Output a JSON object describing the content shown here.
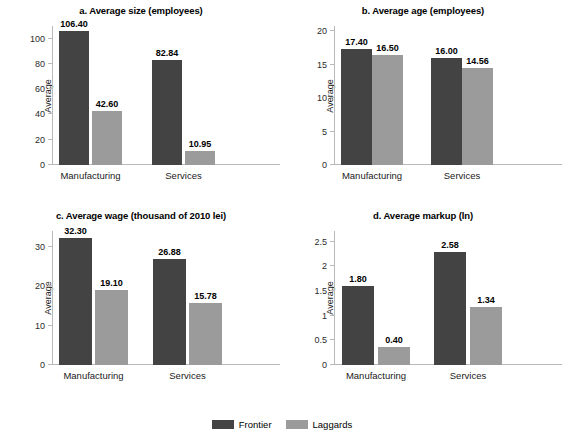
{
  "figure": {
    "background": "#ffffff",
    "colors": {
      "frontier": "#434343",
      "laggards": "#9b9b9b",
      "axis": "#b9b9b9",
      "text": "#1a1a1a"
    }
  },
  "legend": {
    "position": "bottom-center",
    "entries": [
      {
        "name": "Frontier",
        "color": "#434343"
      },
      {
        "name": "Laggards",
        "color": "#9b9b9b"
      }
    ]
  },
  "chart_data": [
    {
      "id": "a",
      "type": "bar",
      "title": "a. Average size (employees)",
      "xlabel": "",
      "ylabel": "Average",
      "categories": [
        "Manufacturing",
        "Services"
      ],
      "ylim": [
        0,
        110
      ],
      "yticks": [
        0,
        20,
        40,
        60,
        80,
        100
      ],
      "ytick_labels": [
        "0",
        "20",
        "40",
        "60",
        "80",
        "100"
      ],
      "grid": false,
      "series": [
        {
          "name": "Frontier",
          "values": [
            106.4,
            82.84
          ],
          "labels": [
            "106.40",
            "82.84"
          ]
        },
        {
          "name": "Laggards",
          "values": [
            42.6,
            10.95
          ],
          "labels": [
            "42.60",
            "10.95"
          ]
        }
      ]
    },
    {
      "id": "b",
      "type": "bar",
      "title": "b. Average age (employees)",
      "xlabel": "",
      "ylabel": "Average",
      "categories": [
        "Manufacturing",
        "Services"
      ],
      "ylim": [
        0,
        20.8
      ],
      "yticks": [
        0,
        5,
        10,
        15,
        20
      ],
      "ytick_labels": [
        "0",
        "5",
        "10",
        "15",
        "20"
      ],
      "grid": false,
      "series": [
        {
          "name": "Frontier",
          "values": [
            17.4,
            16.0
          ],
          "labels": [
            "17.40",
            "16.00"
          ]
        },
        {
          "name": "Laggards",
          "values": [
            16.5,
            14.56
          ],
          "labels": [
            "16.50",
            "14.56"
          ]
        }
      ]
    },
    {
      "id": "c",
      "type": "bar",
      "title": "c. Average wage (thousand of 2010 lei)",
      "xlabel": "",
      "ylabel": "Average",
      "categories": [
        "Manufacturing",
        "Services"
      ],
      "ylim": [
        0,
        34
      ],
      "yticks": [
        0,
        10,
        20,
        30
      ],
      "ytick_labels": [
        "0",
        "10",
        "20",
        "30"
      ],
      "grid": false,
      "series": [
        {
          "name": "Frontier",
          "values": [
            32.3,
            26.88
          ],
          "labels": [
            "32.30",
            "26.88"
          ]
        },
        {
          "name": "Laggards",
          "values": [
            19.1,
            15.78
          ],
          "labels": [
            "19.10",
            "15.78"
          ]
        }
      ]
    },
    {
      "id": "d",
      "type": "bar",
      "title": "d. Average markup (ln)",
      "xlabel": "",
      "ylabel": "Average",
      "categories": [
        "Manufacturing",
        "Services"
      ],
      "ylim": [
        0,
        2.72
      ],
      "yticks": [
        0,
        0.5,
        1,
        1.5,
        2,
        2.5
      ],
      "ytick_labels": [
        "0",
        "0.5",
        "1",
        "1.5",
        "2",
        "2.5"
      ],
      "grid": false,
      "series": [
        {
          "name": "Frontier",
          "values": [
            1.8,
            2.58
          ],
          "labels": [
            "1.80",
            "2.58"
          ],
          "plotted": [
            1.61,
            2.3
          ]
        },
        {
          "name": "Laggards",
          "values": [
            0.4,
            1.34
          ],
          "labels": [
            "0.40",
            "1.34"
          ],
          "plotted": [
            0.36,
            1.18
          ]
        }
      ]
    }
  ]
}
